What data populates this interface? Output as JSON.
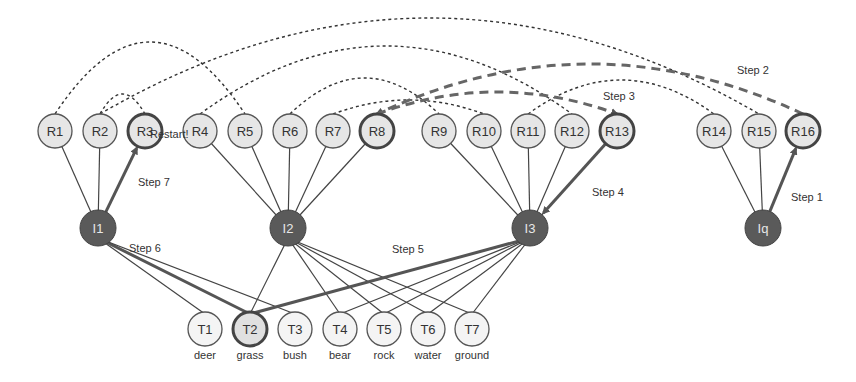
{
  "colors": {
    "r_fill": "#e6e6e6",
    "r_stroke": "#555555",
    "i_fill": "#5a5a5a",
    "line": "#444444",
    "highlight": "#555555"
  },
  "r_nodes": [
    {
      "id": "R1",
      "x": 55,
      "y": 131,
      "highlight": false
    },
    {
      "id": "R2",
      "x": 100,
      "y": 131,
      "highlight": false
    },
    {
      "id": "R3",
      "x": 145,
      "y": 131,
      "highlight": true
    },
    {
      "id": "R4",
      "x": 200,
      "y": 131,
      "highlight": false
    },
    {
      "id": "R5",
      "x": 245,
      "y": 131,
      "highlight": false
    },
    {
      "id": "R6",
      "x": 290,
      "y": 131,
      "highlight": false
    },
    {
      "id": "R7",
      "x": 333,
      "y": 131,
      "highlight": false
    },
    {
      "id": "R8",
      "x": 377,
      "y": 131,
      "highlight": true
    },
    {
      "id": "R9",
      "x": 439,
      "y": 131,
      "highlight": false
    },
    {
      "id": "R10",
      "x": 484,
      "y": 131,
      "highlight": false
    },
    {
      "id": "R11",
      "x": 528,
      "y": 131,
      "highlight": false
    },
    {
      "id": "R12",
      "x": 572,
      "y": 131,
      "highlight": false
    },
    {
      "id": "R13",
      "x": 617,
      "y": 131,
      "highlight": true
    },
    {
      "id": "R14",
      "x": 714,
      "y": 131,
      "highlight": false
    },
    {
      "id": "R15",
      "x": 759,
      "y": 131,
      "highlight": false
    },
    {
      "id": "R16",
      "x": 803,
      "y": 131,
      "highlight": true
    }
  ],
  "i_nodes": [
    {
      "id": "I1",
      "x": 98,
      "y": 228,
      "children": [
        "R1",
        "R2",
        "R3"
      ]
    },
    {
      "id": "I2",
      "x": 288,
      "y": 228,
      "children": [
        "R4",
        "R5",
        "R6",
        "R7",
        "R8"
      ]
    },
    {
      "id": "I3",
      "x": 530,
      "y": 228,
      "children": [
        "R9",
        "R10",
        "R11",
        "R12",
        "R13"
      ]
    },
    {
      "id": "Iq",
      "x": 763,
      "y": 228,
      "children": [
        "R14",
        "R15",
        "R16"
      ]
    }
  ],
  "t_nodes": [
    {
      "id": "T1",
      "word": "deer",
      "x": 205,
      "y": 329,
      "highlight": false
    },
    {
      "id": "T2",
      "word": "grass",
      "x": 250,
      "y": 329,
      "highlight": true
    },
    {
      "id": "T3",
      "word": "bush",
      "x": 295,
      "y": 329,
      "highlight": false
    },
    {
      "id": "T4",
      "word": "bear",
      "x": 340,
      "y": 329,
      "highlight": false
    },
    {
      "id": "T5",
      "word": "rock",
      "x": 384,
      "y": 329,
      "highlight": false
    },
    {
      "id": "T6",
      "word": "water",
      "x": 428,
      "y": 329,
      "highlight": false
    },
    {
      "id": "T7",
      "word": "ground",
      "x": 472,
      "y": 329,
      "highlight": false
    }
  ],
  "i_t_edges": [
    {
      "from": "I1",
      "to": "T1"
    },
    {
      "from": "I1",
      "to": "T2",
      "bold": true
    },
    {
      "from": "I1",
      "to": "T3"
    },
    {
      "from": "I2",
      "to": "T2"
    },
    {
      "from": "I2",
      "to": "T4"
    },
    {
      "from": "I2",
      "to": "T5"
    },
    {
      "from": "I2",
      "to": "T6"
    },
    {
      "from": "I2",
      "to": "T7"
    },
    {
      "from": "I3",
      "to": "T2",
      "bold": true
    },
    {
      "from": "I3",
      "to": "T4"
    },
    {
      "from": "I3",
      "to": "T5"
    },
    {
      "from": "I3",
      "to": "T6"
    },
    {
      "from": "I3",
      "to": "T7"
    }
  ],
  "arcs": [
    {
      "from": "R1",
      "to": "R5",
      "peak": 42,
      "style": "dotted"
    },
    {
      "from": "R2",
      "to": "R15",
      "peak": 18,
      "style": "dotted"
    },
    {
      "from": "R2",
      "to": "R3",
      "peak": 94,
      "style": "dotted"
    },
    {
      "from": "R4",
      "to": "R12",
      "peak": 46,
      "style": "dotted"
    },
    {
      "from": "R6",
      "to": "R9",
      "peak": 78,
      "style": "dotted"
    },
    {
      "from": "R7",
      "to": "R10",
      "peak": 100,
      "style": "dotted"
    },
    {
      "from": "R11",
      "to": "R14",
      "peak": 80,
      "style": "dotted"
    },
    {
      "from": "R16",
      "to": "R8",
      "peak": 64,
      "style": "bold-dashed",
      "arrow": true
    },
    {
      "from": "R8",
      "to": "R13",
      "peak": 92,
      "style": "bold-dashed",
      "arrow": true
    }
  ],
  "step_arrows": [
    {
      "from": "Iq",
      "to": "R16",
      "label": "Step 1"
    },
    {
      "from": "R13",
      "to": "I3",
      "label": "Step 4"
    },
    {
      "from": "I1",
      "to": "R3",
      "label": "Step 7"
    }
  ],
  "labels": {
    "restart": "Restart!",
    "step1": "Step 1",
    "step2": "Step 2",
    "step3": "Step 3",
    "step4": "Step 4",
    "step5": "Step 5",
    "step6": "Step 6",
    "step7": "Step 7"
  }
}
